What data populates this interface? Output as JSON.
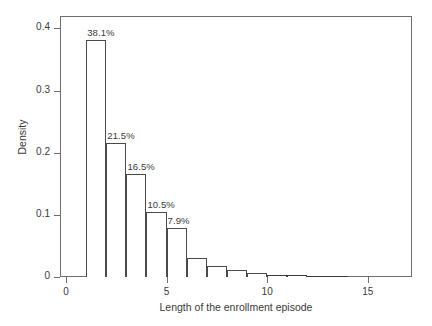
{
  "chart_data": {
    "type": "bar",
    "title": "",
    "subtitle": "",
    "xlabel": "Length of the enrollment episode",
    "ylabel": "Density",
    "xlim": [
      -0.3,
      17.2
    ],
    "ylim": [
      0,
      0.42
    ],
    "grid": false,
    "legend": null,
    "bin_width": 1,
    "x_ticks": [
      {
        "value": 0,
        "label": "0"
      },
      {
        "value": 5,
        "label": "5"
      },
      {
        "value": 10,
        "label": "10"
      },
      {
        "value": 15,
        "label": "15"
      }
    ],
    "y_ticks": [
      {
        "value": 0,
        "label": "0"
      },
      {
        "value": 0.1,
        "label": "0.1"
      },
      {
        "value": 0.2,
        "label": "0.2"
      },
      {
        "value": 0.3,
        "label": "0.3"
      },
      {
        "value": 0.4,
        "label": "0.4"
      }
    ],
    "bins": [
      {
        "x_start": 1,
        "x_end": 2,
        "density": 0.381,
        "label": "38.1%"
      },
      {
        "x_start": 2,
        "x_end": 3,
        "density": 0.215,
        "label": "21.5%"
      },
      {
        "x_start": 3,
        "x_end": 4,
        "density": 0.165,
        "label": "16.5%"
      },
      {
        "x_start": 4,
        "x_end": 5,
        "density": 0.105,
        "label": "10.5%"
      },
      {
        "x_start": 5,
        "x_end": 6,
        "density": 0.079,
        "label": "7.9%"
      },
      {
        "x_start": 6,
        "x_end": 7,
        "density": 0.03,
        "label": ""
      },
      {
        "x_start": 7,
        "x_end": 8,
        "density": 0.018,
        "label": ""
      },
      {
        "x_start": 8,
        "x_end": 9,
        "density": 0.011,
        "label": ""
      },
      {
        "x_start": 9,
        "x_end": 10,
        "density": 0.006,
        "label": ""
      },
      {
        "x_start": 10,
        "x_end": 11,
        "density": 0.004,
        "label": ""
      },
      {
        "x_start": 11,
        "x_end": 12,
        "density": 0.003,
        "label": ""
      },
      {
        "x_start": 12,
        "x_end": 13,
        "density": 0.002,
        "label": ""
      },
      {
        "x_start": 13,
        "x_end": 14,
        "density": 0.002,
        "label": ""
      }
    ],
    "categories": [
      "1",
      "2",
      "3",
      "4",
      "5",
      "6",
      "7",
      "8",
      "9",
      "10",
      "11",
      "12",
      "13"
    ],
    "values": [
      0.381,
      0.215,
      0.165,
      0.105,
      0.079,
      0.03,
      0.018,
      0.011,
      0.006,
      0.004,
      0.003,
      0.002,
      0.002
    ]
  },
  "style": {
    "frame_color": "#6e6e6e",
    "bar_edge_color": "#4a4a4a",
    "bar_fill_color": "#ffffff",
    "text_color": "#3a3a3a",
    "background": "#ffffff"
  }
}
